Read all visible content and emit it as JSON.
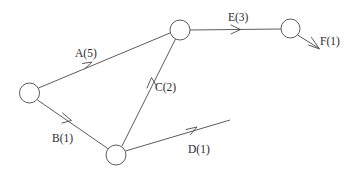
{
  "diagram": {
    "type": "directed-graph",
    "background_color": "#ffffff",
    "line_color": "#4a4a4a",
    "text_color": "#2b2b2b",
    "nodes": [
      {
        "id": "n1",
        "name": "start-node",
        "cx": 29.5,
        "cy": 93,
        "r": 10
      },
      {
        "id": "n2",
        "name": "top-node",
        "cx": 180,
        "cy": 30,
        "r": 10
      },
      {
        "id": "n3",
        "name": "bottom-node",
        "cx": 116,
        "cy": 155,
        "r": 10
      },
      {
        "id": "n4",
        "name": "right-node",
        "cx": 290.5,
        "cy": 28.5,
        "r": 9.5
      }
    ],
    "edges": [
      {
        "id": "edge-a",
        "label": "A(5)",
        "activity": "A",
        "duration": 5,
        "from": "n1",
        "to": "n2",
        "path": "M 38.5 88 L 170 33",
        "arrow": "M 82.5 63.5 L 92 62 L 85 68.5",
        "label_x": 75,
        "label_y": 57
      },
      {
        "id": "edge-b",
        "label": "B(1)",
        "activity": "B",
        "duration": 1,
        "from": "n1",
        "to": "n3",
        "path": "M 37.5 100 L 108.5 149",
        "arrow": "M 62.5 113 L 71.5 120.5 L 62 123",
        "label_x": 52,
        "label_y": 142
      },
      {
        "id": "edge-c",
        "label": "C(2)",
        "activity": "C",
        "duration": 2,
        "from": "n3",
        "to": "n2",
        "path": "M 122 146 L 175.5 39",
        "arrow": "M 147 88 L 151.5 77.5 L 156 85",
        "label_x": 155,
        "label_y": 91
      },
      {
        "id": "edge-e",
        "label": "E(3)",
        "activity": "E",
        "duration": 3,
        "from": "n2",
        "to": "n4",
        "path": "M 190 30 L 281 29",
        "arrow": "M 231 25 L 240.5 29.5 L 231 34",
        "label_x": 228,
        "label_y": 21
      },
      {
        "id": "edge-d",
        "label": "D(1)",
        "activity": "D",
        "duration": 1,
        "from": "n3",
        "to": null,
        "path": "M 125.5 151 L 230 120",
        "arrow": "M 186 129.5 L 197 127 L 190.5 134.5",
        "label_x": 188,
        "label_y": 153
      },
      {
        "id": "edge-f",
        "label": "F(1)",
        "activity": "F",
        "duration": 1,
        "from": "n4",
        "to": null,
        "path": "M 297.5 35 L 318.5 48",
        "arrow": "M 308.5 45 L 319.5 49 L 311.5 37.5",
        "label_x": 320,
        "label_y": 45
      }
    ]
  }
}
